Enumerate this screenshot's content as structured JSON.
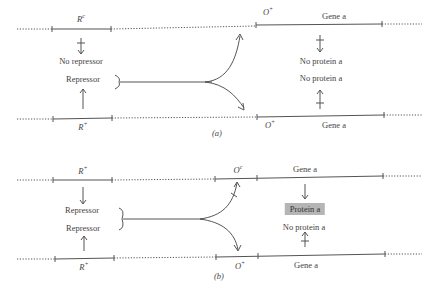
{
  "panel_a": {
    "caption": "(a)",
    "top_strand": {
      "regulator_label": "R",
      "regulator_sup": "c",
      "operator_label": "O",
      "operator_sup": "+",
      "gene_label": "Gene a"
    },
    "bottom_strand": {
      "regulator_label": "R",
      "regulator_sup": "+",
      "operator_label": "O",
      "operator_sup": "+",
      "gene_label": "Gene a"
    },
    "left_labels": [
      "No repressor",
      "Repressor"
    ],
    "right_labels": [
      "No protein a",
      "No protein a"
    ]
  },
  "panel_b": {
    "caption": "(b)",
    "top_strand": {
      "regulator_label": "R",
      "regulator_sup": "+",
      "operator_label": "O",
      "operator_sup": "c",
      "gene_label": "Gene a"
    },
    "bottom_strand": {
      "regulator_label": "R",
      "regulator_sup": "+",
      "operator_label": "O",
      "operator_sup": "+",
      "gene_label": "Gene a"
    },
    "left_labels": [
      "Repressor",
      "Repressor"
    ],
    "right_labels": [
      "Protein a",
      "No protein a"
    ]
  }
}
